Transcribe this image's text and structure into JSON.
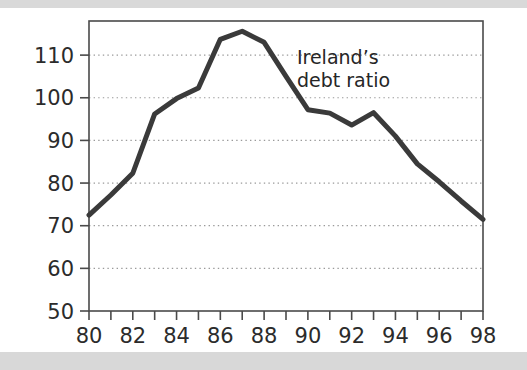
{
  "figure": {
    "background_color": "#ffffff",
    "scan_band_color": "#d9d9d9"
  },
  "chart_data": {
    "type": "line",
    "title": "",
    "subtitle": "",
    "xlabel": "",
    "ylabel": "",
    "annotations": [
      {
        "name": "series-label",
        "text_line1": "Ireland’s",
        "text_line2": "debt ratio",
        "x": 89.5,
        "y": 108
      }
    ],
    "series": [
      {
        "name": "Ireland's debt ratio",
        "color": "#3a3a3a",
        "line_width": 5,
        "x": [
          80,
          81,
          82,
          83,
          84,
          85,
          86,
          87,
          88,
          89,
          90,
          91,
          92,
          93,
          94,
          95,
          96,
          97,
          98
        ],
        "values": [
          72.5,
          77.2,
          82.3,
          96.2,
          99.8,
          102.3,
          113.7,
          115.6,
          113.0,
          105.0,
          97.2,
          96.4,
          93.6,
          96.5,
          91.0,
          84.5,
          80.3,
          75.8,
          71.5
        ]
      }
    ],
    "x": [
      80,
      81,
      82,
      83,
      84,
      85,
      86,
      87,
      88,
      89,
      90,
      91,
      92,
      93,
      94,
      95,
      96,
      97,
      98
    ],
    "xlim": [
      80,
      98
    ],
    "ylim": [
      50,
      118
    ],
    "xticks": [
      80,
      81,
      82,
      83,
      84,
      85,
      86,
      87,
      88,
      89,
      90,
      91,
      92,
      93,
      94,
      95,
      96,
      97,
      98
    ],
    "xticklabels": [
      "80",
      "",
      "82",
      "",
      "84",
      "",
      "86",
      "",
      "88",
      "",
      "90",
      "",
      "92",
      "",
      "94",
      "",
      "96",
      "",
      "98"
    ],
    "yticks": [
      50,
      60,
      70,
      80,
      90,
      100,
      110
    ],
    "yticklabels": [
      "50",
      "60",
      "70",
      "80",
      "90",
      "100",
      "110"
    ],
    "grid": {
      "horizontal": true,
      "vertical": false,
      "style": "dotted",
      "color": "#9a9a9a"
    },
    "legend": {
      "visible": false,
      "position": "none"
    },
    "axes": {
      "frame": true,
      "frame_color": "#4a4a4a"
    }
  }
}
